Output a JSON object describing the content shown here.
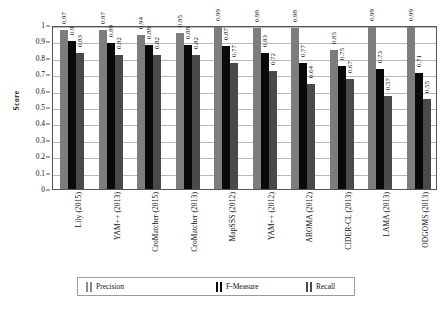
{
  "chart_data": {
    "type": "bar",
    "title": "",
    "subtitle": "",
    "xlabel": "",
    "ylabel": "Score",
    "ylim": [
      0,
      1
    ],
    "ytick_labels": [
      "1",
      "0.9",
      "0.8",
      "0.7",
      "0.6",
      "0.5",
      "0.4",
      "0.3",
      "0.2",
      "0.1",
      "0"
    ],
    "ytick_values": [
      1,
      0.9,
      0.8,
      0.7,
      0.6,
      0.5,
      0.4,
      0.3,
      0.2,
      0.1,
      0
    ],
    "grid": true,
    "legend_position": "bottom",
    "categories": [
      "Lily  (2015)",
      "YAM++  (2013)",
      "CroMatcher (2015)",
      "CroMatcher (2013)",
      "MapSSS  (2012)",
      "YAM++  (2012)",
      "AROMA  (2012)",
      "CIDER-CL  (2013)",
      "LAMA  (2013)",
      "ODGOMS (2013)"
    ],
    "series": [
      {
        "name": "Precision",
        "color": "#7d7d7d",
        "values": [
          0.97,
          0.97,
          0.94,
          0.95,
          0.99,
          0.98,
          0.98,
          0.85,
          0.99,
          0.99
        ],
        "labels": [
          "0.97",
          "0.97",
          "0.94",
          "0.95",
          "0.99",
          "0.98",
          "0.98",
          "0.85",
          "0.99",
          "0.99"
        ]
      },
      {
        "name": "F-Measure",
        "color": "#0a0a0a",
        "values": [
          0.9,
          0.89,
          0.88,
          0.88,
          0.87,
          0.83,
          0.77,
          0.75,
          0.73,
          0.71
        ],
        "labels": [
          "0.9",
          "0.89",
          "0.88",
          "0.88",
          "0.87",
          "0.83",
          "0.77",
          "0.75",
          "0.73",
          "0.71"
        ]
      },
      {
        "name": "Recall",
        "color": "#4a4a4a",
        "values": [
          0.83,
          0.82,
          0.82,
          0.82,
          0.77,
          0.72,
          0.64,
          0.67,
          0.57,
          0.55
        ],
        "labels": [
          "0.83",
          "0.82",
          "0.82",
          "0.82",
          "0.77",
          "0.72",
          "0.64",
          "0.67",
          "0.57",
          "0.55"
        ]
      }
    ]
  },
  "legend": {
    "items": [
      {
        "label": "Precision",
        "swatch": "precision-swatch-icon"
      },
      {
        "label": "F-Measure",
        "swatch": "fmeasure-swatch-icon"
      },
      {
        "label": "Recall",
        "swatch": "recall-swatch-icon"
      }
    ]
  },
  "axis": {
    "y_title": "Score"
  }
}
